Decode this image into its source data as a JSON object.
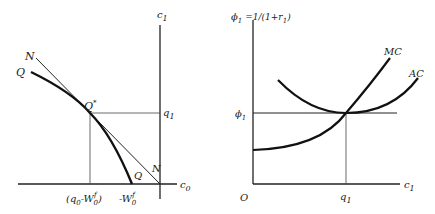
{
  "left_panel": {
    "axes": {
      "vertical": "c",
      "vertical_sub": "1",
      "horizontal": "c",
      "horizontal_sub": "0"
    },
    "curves": {
      "line_label_top": "N",
      "line_label_bottom": "N",
      "curve_label_top": "Q",
      "curve_label_bottom": "Q"
    },
    "point": {
      "label": "Q",
      "sup": "*"
    },
    "ticks": {
      "y_tick": "q",
      "y_tick_sub": "1",
      "x_tick_1_open": "(q",
      "x_tick_1_sub0": "0",
      "x_tick_1_mid": "-W",
      "x_tick_1_sub": "0",
      "x_tick_1_sup": "f",
      "x_tick_1_close": ")",
      "x_tick_2_prefix": "-W",
      "x_tick_2_sub": "0",
      "x_tick_2_sup": "f"
    }
  },
  "right_panel": {
    "axes": {
      "vertical_sym": "ϕ",
      "vertical_sub": "1",
      "vertical_eq": "=1/(1+r",
      "vertical_eq_sub": "1",
      "vertical_eq_close": ")",
      "horizontal": "c",
      "horizontal_sub": "1",
      "origin": "O"
    },
    "curves": {
      "mc_label": "MC",
      "ac_label": "AC"
    },
    "ticks": {
      "y_tick_sym": "ϕ",
      "y_tick_sub": "1",
      "x_tick": "q",
      "x_tick_sub": "1"
    }
  }
}
